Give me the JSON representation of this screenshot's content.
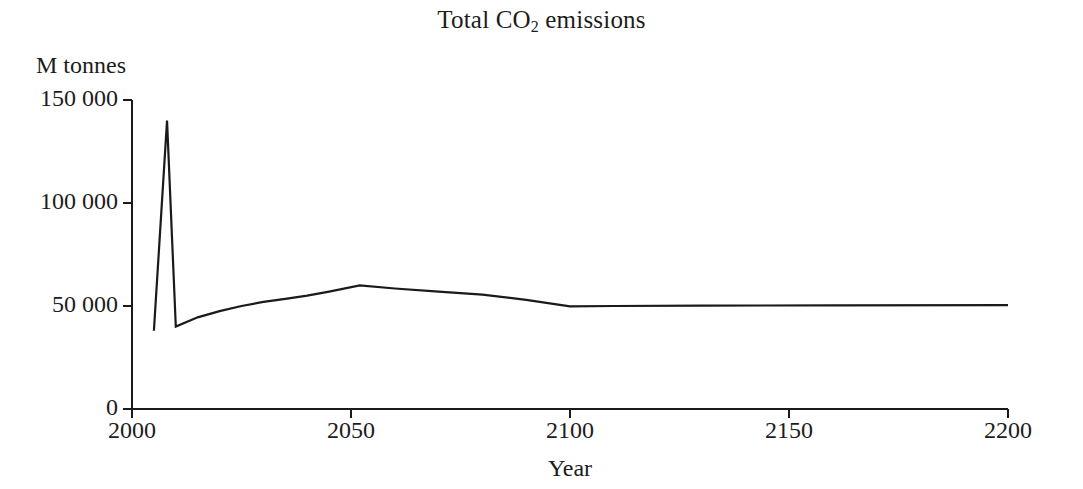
{
  "chart_data": {
    "type": "line",
    "title": "Total CO2 emissions",
    "title_prefix": "Total CO",
    "title_subscript": "2",
    "title_suffix": " emissions",
    "xlabel": "Year",
    "ylabel": "M tonnes",
    "xlim": [
      2000,
      2200
    ],
    "ylim": [
      0,
      150000
    ],
    "xticks": [
      2000,
      2050,
      2100,
      2150,
      2200
    ],
    "xtick_labels": [
      "2000",
      "2050",
      "2100",
      "2150",
      "2200"
    ],
    "yticks": [
      0,
      50000,
      100000,
      150000
    ],
    "ytick_labels": [
      "0",
      "50 000",
      "100 000",
      "150 000"
    ],
    "grid": false,
    "legend": false,
    "line_color": "#1a1a1a",
    "line_width": 2.2,
    "series": [
      {
        "name": "Total CO2 emissions",
        "x": [
          2005,
          2008,
          2010,
          2015,
          2020,
          2025,
          2030,
          2035,
          2040,
          2045,
          2052,
          2060,
          2070,
          2080,
          2090,
          2100,
          2110,
          2130,
          2160,
          2200
        ],
        "values": [
          38000,
          140000,
          40000,
          44500,
          47500,
          50000,
          52000,
          53500,
          55000,
          57000,
          60000,
          58500,
          57000,
          55500,
          53000,
          49800,
          50000,
          50200,
          50300,
          50400
        ]
      }
    ],
    "annotations": {
      "peak_year": 2008,
      "peak_value": 140000,
      "trough_year": 2010,
      "trough_value": 40000,
      "secondary_peak_year": 2052,
      "secondary_peak_value": 60000,
      "plateau_value": 50000
    }
  },
  "axes": {
    "y_unit_label": "M tonnes",
    "x_caption": "Year"
  }
}
